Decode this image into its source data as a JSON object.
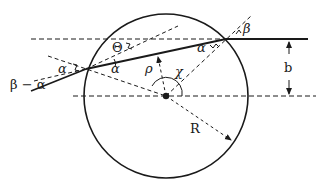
{
  "diagram": {
    "colors": {
      "stroke": "#1a1a1a",
      "background": "#ffffff"
    },
    "circle": {
      "cx": 166,
      "cy": 96,
      "r": 82
    },
    "labels": {
      "theta": "Θ",
      "alpha_left": "α",
      "alpha_inner": "α",
      "alpha_right": "α",
      "beta": "β",
      "beta_minus_alpha": "β − α",
      "rho": "ρ",
      "chi": "χ",
      "R": "R",
      "b": "b"
    }
  }
}
